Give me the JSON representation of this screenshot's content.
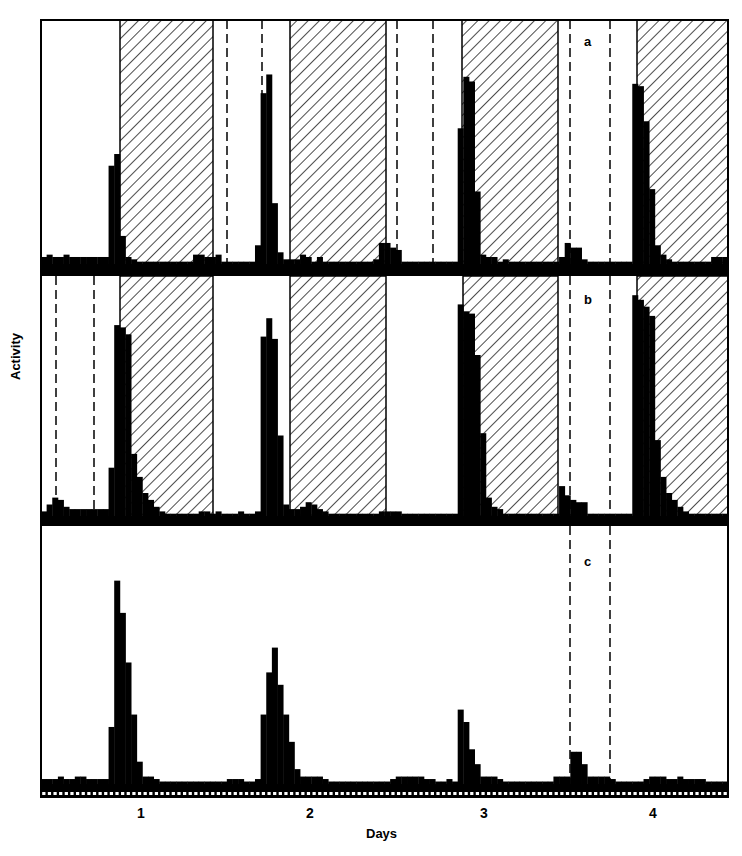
{
  "chart_data": {
    "type": "bar",
    "title": "",
    "xlabel": "Days",
    "ylabel": "Activity",
    "x_ticks": [
      "1",
      "2",
      "3",
      "4"
    ],
    "grid": false,
    "legend": null,
    "bins_per_day": 24,
    "panels": [
      {
        "label": "a",
        "shaded_dark_periods_x": [
          [
            120,
            213
          ],
          [
            290,
            386
          ],
          [
            462,
            558
          ],
          [
            637,
            728
          ]
        ],
        "dashed_lines_x": [
          227,
          262,
          397,
          433,
          570,
          610
        ],
        "series": [
          {
            "name": "Activity (a)",
            "values": [
              3,
              4,
              3,
              3,
              4,
              3,
              3,
              3,
              3,
              3,
              3,
              3,
              42,
              47,
              12,
              3,
              2,
              1,
              1,
              1,
              1,
              1,
              1,
              1,
              1,
              1,
              1,
              4,
              4,
              3,
              3,
              4,
              1,
              1,
              1,
              1,
              1,
              1,
              8,
              73,
              81,
              26,
              5,
              2,
              2,
              2,
              4,
              3,
              1,
              3,
              1,
              1,
              1,
              1,
              1,
              1,
              1,
              1,
              1,
              2,
              9,
              9,
              7,
              6,
              1,
              1,
              1,
              1,
              1,
              1,
              1,
              1,
              1,
              1,
              58,
              80,
              78,
              31,
              4,
              3,
              3,
              1,
              2,
              1,
              1,
              1,
              1,
              1,
              1,
              1,
              1,
              1,
              3,
              9,
              7,
              7,
              2,
              1,
              1,
              1,
              1,
              1,
              1,
              1,
              1,
              77,
              76,
              61,
              32,
              8,
              4,
              2,
              1,
              1,
              1,
              1,
              1,
              1,
              1,
              3,
              3,
              3
            ]
          }
        ]
      },
      {
        "label": "b",
        "shaded_dark_periods_x": [
          [
            120,
            213
          ],
          [
            290,
            386
          ],
          [
            463,
            558
          ],
          [
            637,
            728
          ]
        ],
        "dashed_lines_x": [
          56,
          94,
          570,
          610
        ],
        "series": [
          {
            "name": "Activity (b)",
            "values": [
              2,
              5,
              8,
              7,
              4,
              3,
              3,
              3,
              3,
              3,
              3,
              3,
              21,
              83,
              82,
              79,
              27,
              17,
              10,
              7,
              4,
              2,
              1,
              1,
              1,
              1,
              1,
              1,
              2,
              2,
              1,
              2,
              1,
              1,
              1,
              2,
              1,
              1,
              2,
              78,
              86,
              77,
              35,
              5,
              3,
              3,
              4,
              6,
              5,
              3,
              2,
              1,
              1,
              1,
              1,
              1,
              1,
              1,
              1,
              1,
              2,
              2,
              2,
              2,
              1,
              1,
              1,
              1,
              1,
              1,
              1,
              1,
              1,
              1,
              92,
              89,
              88,
              70,
              36,
              8,
              4,
              3,
              1,
              1,
              1,
              1,
              1,
              1,
              1,
              1,
              1,
              1,
              13,
              9,
              7,
              6,
              6,
              1,
              1,
              1,
              1,
              1,
              1,
              1,
              1,
              96,
              94,
              91,
              87,
              33,
              17,
              10,
              7,
              4,
              2,
              1,
              1,
              1,
              1,
              1,
              1,
              1
            ]
          }
        ]
      },
      {
        "label": "c",
        "shaded_dark_periods_x": [],
        "dashed_lines_x": [
          570,
          610
        ],
        "series": [
          {
            "name": "Activity (c)",
            "values": [
              2,
              2,
              2,
              3,
              2,
              2,
              3,
              3,
              2,
              2,
              2,
              2,
              23,
              82,
              69,
              49,
              28,
              9,
              3,
              3,
              2,
              1,
              1,
              1,
              1,
              1,
              1,
              1,
              1,
              1,
              1,
              1,
              1,
              2,
              2,
              2,
              1,
              1,
              2,
              28,
              45,
              55,
              40,
              28,
              17,
              6,
              3,
              3,
              3,
              3,
              2,
              1,
              1,
              1,
              1,
              1,
              1,
              1,
              1,
              1,
              1,
              1,
              2,
              3,
              3,
              3,
              3,
              3,
              2,
              2,
              1,
              1,
              2,
              1,
              30,
              25,
              14,
              8,
              3,
              3,
              3,
              2,
              1,
              1,
              1,
              1,
              1,
              1,
              1,
              1,
              1,
              3,
              3,
              3,
              13,
              13,
              8,
              3,
              3,
              3,
              3,
              2,
              1,
              1,
              1,
              1,
              1,
              2,
              3,
              3,
              3,
              2,
              2,
              3,
              2,
              2,
              2,
              2,
              1,
              1,
              1,
              1
            ]
          }
        ]
      }
    ],
    "ylim": [
      0,
      100
    ]
  },
  "labels": {
    "ylabel": "Activity",
    "xlabel": "Days",
    "days": [
      "1",
      "2",
      "3",
      "4"
    ],
    "panel_a": "a",
    "panel_b": "b",
    "panel_c": "c"
  },
  "colors": {
    "ink": "#000000",
    "paper": "#ffffff"
  }
}
